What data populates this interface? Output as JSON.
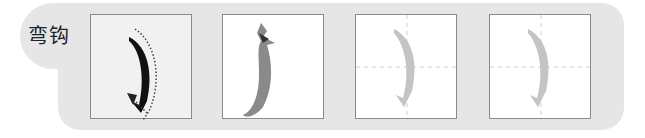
{
  "stroke": {
    "name": "弯钩",
    "label": "弯钩"
  },
  "boxes": [
    {
      "id": 1,
      "kind": "stroke-direction-demo",
      "description": "black bent-hook stroke with dotted arrow showing writing direction"
    },
    {
      "id": 2,
      "kind": "illustration",
      "description": "hook-shaped gourd/vegetable resembling the stroke"
    },
    {
      "id": 3,
      "kind": "tracing-grid",
      "description": "light grey stroke on dashed cross grid for tracing"
    },
    {
      "id": 4,
      "kind": "tracing-grid",
      "description": "light grey stroke on dashed cross grid for tracing"
    }
  ],
  "colors": {
    "panel": "#e6e6e6",
    "box_border": "#8a8a8a",
    "stroke_dark": "#111111",
    "stroke_trace": "#c4c4c4",
    "grid_dash": "#cfcfcf",
    "vegetable": "#8a8a8a"
  }
}
